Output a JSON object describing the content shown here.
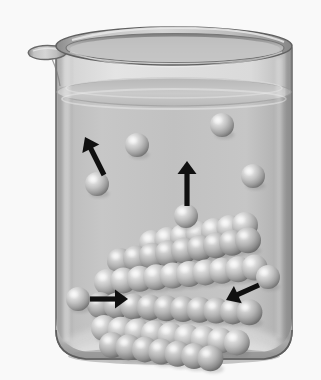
{
  "figure": {
    "caption": "",
    "background_color": "#ffffff",
    "width": 321,
    "height": 380
  },
  "beaker": {
    "name": "glass beaker",
    "glass_color": "#cfcfcf",
    "glass_edge_color": "#6d6d6d",
    "rim_color": "#b5b5b5",
    "wall_left_x": 55,
    "wall_right_x": 292,
    "rim_y": 34,
    "base_y": 358,
    "spout_label": "pouring spout",
    "spout_side": "left"
  },
  "liquid": {
    "name": "solution",
    "color": "#c6c6c6",
    "surface_color": "#bdbdbd",
    "surface_y": 92,
    "label": ""
  },
  "spheres": {
    "color": "#c2c2c2",
    "highlight_color": "#f2f2f2",
    "shadow_color": "#6f6f6f",
    "radius_free": 12,
    "radius_lattice": 13,
    "free_particles": [
      {
        "id": "free-1",
        "cx": 97,
        "cy": 184,
        "r": 12,
        "note": "particle leaving solution, left"
      },
      {
        "id": "free-2",
        "cx": 137,
        "cy": 145,
        "r": 12,
        "note": "dissolved particle upper left"
      },
      {
        "id": "free-3",
        "cx": 222,
        "cy": 125,
        "r": 12,
        "note": "dissolved particle upper right"
      },
      {
        "id": "free-4",
        "cx": 253,
        "cy": 176,
        "r": 12,
        "note": "dissolved particle right"
      },
      {
        "id": "free-5",
        "cx": 186,
        "cy": 216,
        "r": 12,
        "note": "particle moving upward, center"
      },
      {
        "id": "free-6",
        "cx": 78,
        "cy": 299,
        "r": 12,
        "note": "particle approaching crystal, left"
      },
      {
        "id": "free-7",
        "cx": 268,
        "cy": 277,
        "r": 12,
        "note": "particle approaching crystal, right"
      }
    ]
  },
  "crystal": {
    "name": "undissolved solid crystal lattice",
    "arrangement": "cubic close packing, slanted rows",
    "sphere_count": 60,
    "rows": [
      {
        "y": 243,
        "x_start": 152,
        "count": 7,
        "dx": 15.5,
        "dy": -3.0
      },
      {
        "y": 261,
        "x_start": 120,
        "count": 9,
        "dx": 16.0,
        "dy": -2.6
      },
      {
        "y": 282,
        "x_start": 107,
        "count": 10,
        "dx": 16.4,
        "dy": -1.6
      },
      {
        "y": 305,
        "x_start": 100,
        "count": 10,
        "dx": 16.6,
        "dy": 0.8
      },
      {
        "y": 328,
        "x_start": 104,
        "count": 9,
        "dx": 16.6,
        "dy": 1.8
      },
      {
        "y": 345,
        "x_start": 112,
        "count": 7,
        "dx": 16.4,
        "dy": 2.2
      }
    ]
  },
  "arrows": {
    "color": "#101010",
    "items": [
      {
        "id": "arrow-dissolution-left",
        "label": "dissolution",
        "direction": "up-left",
        "x1": 104,
        "y1": 175,
        "x2": 85,
        "y2": 137
      },
      {
        "id": "arrow-dissolution-center",
        "label": "dissolution",
        "direction": "up",
        "x1": 187,
        "y1": 206,
        "x2": 187,
        "y2": 161
      },
      {
        "id": "arrow-crystallization-left",
        "label": "crystallization",
        "direction": "right",
        "x1": 90,
        "y1": 299,
        "x2": 128,
        "y2": 299
      },
      {
        "id": "arrow-crystallization-right",
        "label": "crystallization",
        "direction": "down-left",
        "x1": 259,
        "y1": 285,
        "x2": 226,
        "y2": 300
      }
    ]
  }
}
